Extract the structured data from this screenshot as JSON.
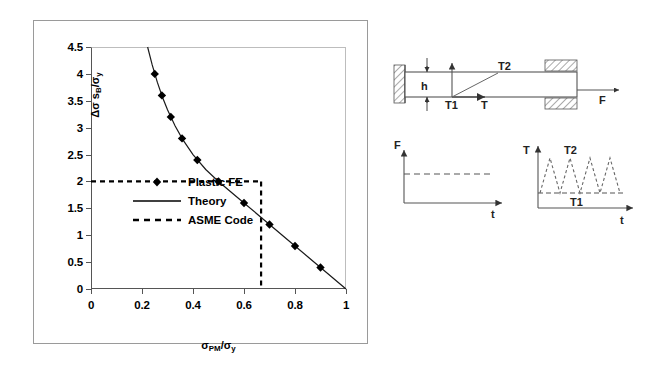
{
  "figure": {
    "caption": ""
  },
  "chart_data": {
    "type": "line",
    "title": "",
    "xlabel": "σPM/σy",
    "ylabel": "Δσ sB/σy",
    "xlim": [
      0,
      1
    ],
    "ylim": [
      0,
      4.5
    ],
    "grid": false,
    "legend_position": "inside-left",
    "xticks": [
      "0",
      "0.2",
      "0.4",
      "0.6",
      "0.8",
      "1"
    ],
    "xtick_values": [
      0,
      0.2,
      0.4,
      0.6,
      0.8,
      1
    ],
    "yticks": [
      "0",
      "0.5",
      "1",
      "1.5",
      "2",
      "2.5",
      "3",
      "3.5",
      "4",
      "4.5"
    ],
    "ytick_values": [
      0,
      0.5,
      1,
      1.5,
      2,
      2.5,
      3,
      3.5,
      4,
      4.5
    ],
    "series": [
      {
        "name": "Plastic FE",
        "marker": "diamond",
        "style": "markers",
        "x": [
          0.25,
          0.278,
          0.313,
          0.357,
          0.417,
          0.5,
          0.6,
          0.7,
          0.8,
          0.9
        ],
        "y": [
          4.0,
          3.6,
          3.2,
          2.8,
          2.4,
          2.0,
          1.6,
          1.2,
          0.8,
          0.4
        ]
      },
      {
        "name": "Theory",
        "style": "solid-line",
        "description": "Bree shakedown boundary, ΔσsB/σy = 1/(σPM/σy) for σPM/σy ≥ 0.5 and 4(1-σPM/σy) for σPM/σy < 0.5",
        "x": [
          0.222,
          0.24,
          0.26,
          0.28,
          0.3,
          0.33,
          0.36,
          0.4,
          0.45,
          0.5,
          0.55,
          0.6,
          0.65,
          0.7,
          0.75,
          0.8,
          0.85,
          0.9,
          0.95,
          1.0
        ],
        "y": [
          4.5,
          4.167,
          3.846,
          3.571,
          3.333,
          3.03,
          2.778,
          2.5,
          2.222,
          2.0,
          1.8,
          1.6,
          1.4,
          1.2,
          1.0,
          0.8,
          0.6,
          0.4,
          0.2,
          0.0
        ]
      },
      {
        "name": "ASME Code",
        "style": "dashed-line",
        "description": "Rectangular limit box",
        "x": [
          0.0,
          0.667,
          0.667
        ],
        "y": [
          2.0,
          2.0,
          0.0
        ],
        "limit_x": 0.667,
        "limit_y": 2.0
      }
    ]
  },
  "legend": {
    "items": [
      {
        "label": "Plastic FE",
        "key": "diamond-marker"
      },
      {
        "label": "Theory",
        "key": "solid-line"
      },
      {
        "label": "ASME Code",
        "key": "dashed-line"
      }
    ]
  },
  "schematic": {
    "beam": {
      "thickness_label": "h",
      "force_label": "F",
      "temperature_inner_label": "T1",
      "temperature_outer_label": "T2",
      "temperature_axis_label": "T"
    },
    "force_plot": {
      "ylabel": "F",
      "xlabel": "t",
      "description": "constant force versus time, dashed horizontal line"
    },
    "temperature_plot": {
      "ylabel": "T",
      "xlabel": "t",
      "peak_label": "T2",
      "base_label": "T1",
      "cycles": 4,
      "description": "cyclic triangular temperature history between T1 and T2"
    }
  }
}
